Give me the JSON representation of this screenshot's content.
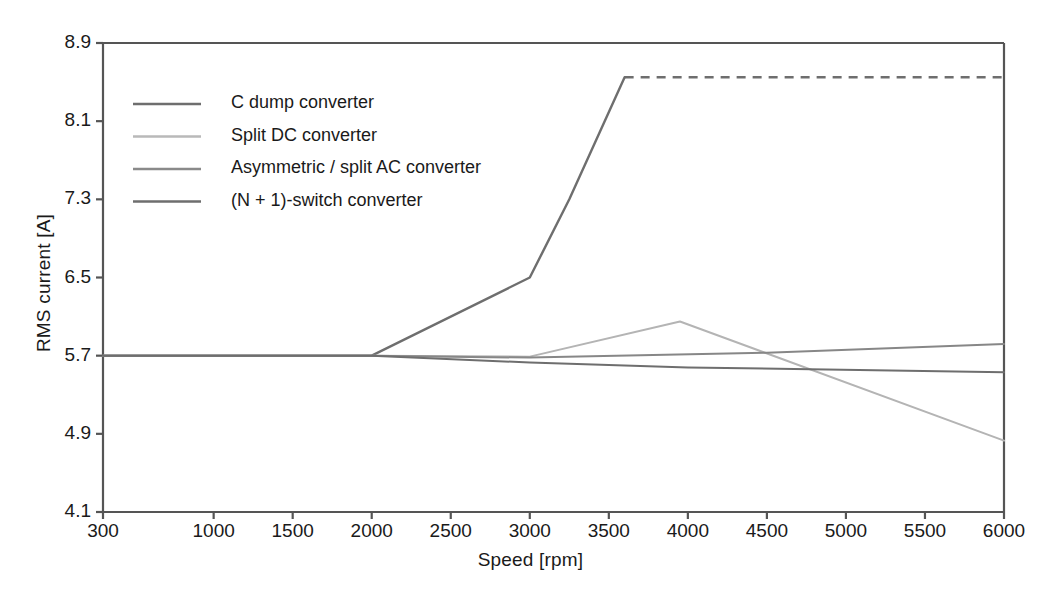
{
  "chart_data": {
    "type": "line",
    "title": "",
    "xlabel": "Speed [rpm]",
    "ylabel": "RMS current [A]",
    "xlim": [
      300,
      6000
    ],
    "ylim": [
      4.1,
      8.9
    ],
    "xticks": [
      300,
      1000,
      1500,
      2000,
      2500,
      3000,
      3500,
      4000,
      4500,
      5000,
      5500,
      6000
    ],
    "yticks": [
      4.1,
      4.9,
      5.7,
      6.5,
      7.3,
      8.1,
      8.9
    ],
    "xtick_labels": [
      "300",
      "1000",
      "1500",
      "2000",
      "2500",
      "3000",
      "3500",
      "4000",
      "4500",
      "5000",
      "5500",
      "6000"
    ],
    "ytick_labels": [
      "4.1",
      "4.9",
      "5.7",
      "6.5",
      "7.3",
      "8.1",
      "8.9"
    ],
    "grid": false,
    "legend_position": "upper-left-inside",
    "series": [
      {
        "name": "C dump converter",
        "color": "#6e6e6e",
        "width": 2.4,
        "x": [
          300,
          2000,
          3000,
          3250,
          3600
        ],
        "y": [
          5.7,
          5.7,
          6.5,
          7.3,
          8.55
        ],
        "dashed_x": [
          3600,
          6000
        ],
        "dashed_y": [
          8.55,
          8.55
        ]
      },
      {
        "name": "Split DC converter",
        "color": "#b4b4b4",
        "width": 2.0,
        "x": [
          300,
          2000,
          3000,
          3950,
          6000
        ],
        "y": [
          5.7,
          5.7,
          5.69,
          6.05,
          4.83
        ]
      },
      {
        "name": "Asymmetric / split AC converter",
        "color": "#878787",
        "width": 2.0,
        "x": [
          300,
          2000,
          3000,
          4500,
          6000
        ],
        "y": [
          5.7,
          5.7,
          5.68,
          5.73,
          5.82
        ]
      },
      {
        "name": "(N + 1)-switch converter",
        "color": "#6e6e6e",
        "width": 2.0,
        "x": [
          300,
          2000,
          3000,
          4000,
          6000
        ],
        "y": [
          5.7,
          5.7,
          5.63,
          5.58,
          5.53
        ]
      }
    ],
    "legend_entries": [
      {
        "label": "C dump converter",
        "color": "#6e6e6e"
      },
      {
        "label": "Split DC converter",
        "color": "#b9b9b9"
      },
      {
        "label": "Asymmetric / split AC converter",
        "color": "#8a8a8a"
      },
      {
        "label": "(N + 1)-switch converter",
        "color": "#6e6e6e"
      }
    ],
    "axis_color": "#555555"
  }
}
